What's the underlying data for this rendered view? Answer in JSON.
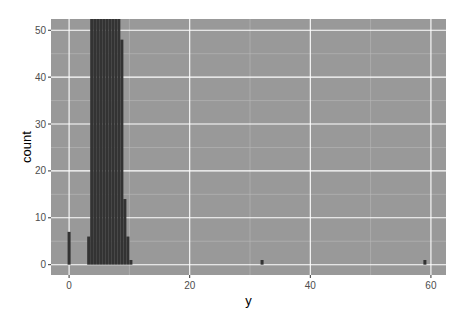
{
  "chart_data": {
    "type": "bar",
    "subtype": "histogram",
    "title": "",
    "xlabel": "y",
    "ylabel": "count",
    "xlim": [
      -3,
      62.5
    ],
    "ylim": [
      -2.2,
      52.4
    ],
    "x_ticks": [
      0,
      20,
      40,
      60
    ],
    "y_ticks": [
      0,
      10,
      20,
      30,
      40,
      50
    ],
    "x_minor_ticks": [
      10,
      30,
      50
    ],
    "y_minor_ticks": [
      5,
      15,
      25,
      35,
      45
    ],
    "grid": true,
    "bin_width": 0.5,
    "bins": [
      {
        "x0": -0.25,
        "x1": 0.25,
        "count": 7
      },
      {
        "x0": 3.0,
        "x1": 3.5,
        "count": 6
      },
      {
        "x0": 3.5,
        "x1": 4.0,
        "count": 60
      },
      {
        "x0": 4.0,
        "x1": 4.5,
        "count": 60
      },
      {
        "x0": 4.5,
        "x1": 5.0,
        "count": 60
      },
      {
        "x0": 5.0,
        "x1": 5.5,
        "count": 60
      },
      {
        "x0": 5.5,
        "x1": 6.0,
        "count": 60
      },
      {
        "x0": 6.0,
        "x1": 6.5,
        "count": 60
      },
      {
        "x0": 6.5,
        "x1": 7.0,
        "count": 60
      },
      {
        "x0": 7.0,
        "x1": 7.5,
        "count": 60
      },
      {
        "x0": 7.5,
        "x1": 8.0,
        "count": 60
      },
      {
        "x0": 8.0,
        "x1": 8.5,
        "count": 60
      },
      {
        "x0": 8.5,
        "x1": 9.0,
        "count": 48
      },
      {
        "x0": 9.0,
        "x1": 9.5,
        "count": 14
      },
      {
        "x0": 9.5,
        "x1": 10.0,
        "count": 6
      },
      {
        "x0": 10.0,
        "x1": 10.5,
        "count": 1
      },
      {
        "x0": 31.75,
        "x1": 32.25,
        "count": 1
      },
      {
        "x0": 58.75,
        "x1": 59.25,
        "count": 1
      }
    ],
    "legend": null,
    "colors": {
      "panel_background": "#999999",
      "grid_major": "#ffffff",
      "grid_minor": "#b8b8b8",
      "bar_fill": "#333333"
    }
  }
}
